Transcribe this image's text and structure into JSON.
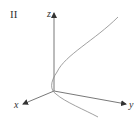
{
  "panel": {
    "label": "II"
  },
  "axes": {
    "x_label": "x",
    "y_label": "y",
    "z_label": "z"
  },
  "colors": {
    "axis": "#333333",
    "curve": "#888888"
  }
}
